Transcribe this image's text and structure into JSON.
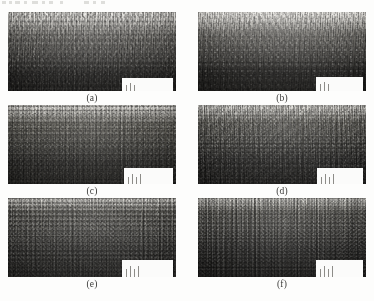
{
  "figure": {
    "background_color": "#fdfdfc",
    "label_color": "#3a3a38",
    "columns": 2,
    "rows": 3,
    "panels": [
      {
        "id": "a",
        "label": "(a)",
        "column": "left",
        "row": 1,
        "frame": {
          "x": 8,
          "y": 12,
          "width": 168,
          "height": 79
        },
        "label_y": 93,
        "texture": {
          "top_tone": "#e6e4df",
          "mid_tone": "#6f6d68",
          "bottom_tone": "#242321",
          "dark_band_start_pct": 52,
          "speckle_density": "high",
          "surface_roughness": "rough",
          "contrast": "high"
        },
        "notch": {
          "x_pct": 68,
          "y_pct": 83,
          "width_pct": 30,
          "height_pct": 17,
          "bars": 3
        }
      },
      {
        "id": "b",
        "label": "(b)",
        "column": "right",
        "row": 1,
        "frame": {
          "x": 198,
          "y": 12,
          "width": 168,
          "height": 79
        },
        "label_y": 93,
        "texture": {
          "top_tone": "#e4e2dd",
          "mid_tone": "#6b6964",
          "bottom_tone": "#201f1d",
          "dark_band_start_pct": 50,
          "speckle_density": "high",
          "surface_roughness": "rough",
          "contrast": "high"
        },
        "notch": {
          "x_pct": 70,
          "y_pct": 82,
          "width_pct": 28,
          "height_pct": 18,
          "bars": 3
        }
      },
      {
        "id": "c",
        "label": "(c)",
        "column": "left",
        "row": 2,
        "frame": {
          "x": 8,
          "y": 105,
          "width": 168,
          "height": 79
        },
        "label_y": 186,
        "texture": {
          "top_tone": "#dedcd6",
          "mid_tone": "#636159",
          "bottom_tone": "#2b2a27",
          "dark_band_start_pct": 46,
          "speckle_density": "very-high",
          "surface_roughness": "medium",
          "contrast": "medium"
        },
        "notch": {
          "x_pct": 69,
          "y_pct": 80,
          "width_pct": 29,
          "height_pct": 20,
          "bars": 4
        }
      },
      {
        "id": "d",
        "label": "(d)",
        "column": "right",
        "row": 2,
        "frame": {
          "x": 198,
          "y": 105,
          "width": 168,
          "height": 79
        },
        "label_y": 186,
        "texture": {
          "top_tone": "#dcdad4",
          "mid_tone": "#605e57",
          "bottom_tone": "#272624",
          "dark_band_start_pct": 44,
          "speckle_density": "very-high",
          "surface_roughness": "medium",
          "contrast": "medium"
        },
        "notch": {
          "x_pct": 71,
          "y_pct": 80,
          "width_pct": 27,
          "height_pct": 20,
          "bars": 4
        }
      },
      {
        "id": "e",
        "label": "(e)",
        "column": "left",
        "row": 3,
        "frame": {
          "x": 8,
          "y": 198,
          "width": 168,
          "height": 79
        },
        "label_y": 279,
        "texture": {
          "top_tone": "#d8d6cf",
          "mid_tone": "#5d5b54",
          "bottom_tone": "#2f2e2b",
          "dark_band_start_pct": 40,
          "speckle_density": "very-high",
          "surface_roughness": "fine",
          "contrast": "low"
        },
        "notch": {
          "x_pct": 68,
          "y_pct": 78,
          "width_pct": 30,
          "height_pct": 22,
          "bars": 4
        }
      },
      {
        "id": "f",
        "label": "(f)",
        "column": "right",
        "row": 3,
        "frame": {
          "x": 198,
          "y": 198,
          "width": 168,
          "height": 79
        },
        "label_y": 279,
        "texture": {
          "top_tone": "#dad8d1",
          "mid_tone": "#56544d",
          "bottom_tone": "#232220",
          "dark_band_start_pct": 38,
          "speckle_density": "very-high",
          "surface_roughness": "fine",
          "contrast": "medium"
        },
        "notch": {
          "x_pct": 70,
          "y_pct": 78,
          "width_pct": 28,
          "height_pct": 22,
          "bars": 4
        }
      }
    ],
    "scan_artifacts": [
      {
        "x": 2,
        "width": 4
      },
      {
        "x": 9,
        "width": 3
      },
      {
        "x": 15,
        "width": 5
      },
      {
        "x": 24,
        "width": 3
      },
      {
        "x": 32,
        "width": 6
      },
      {
        "x": 42,
        "width": 3
      },
      {
        "x": 49,
        "width": 4
      },
      {
        "x": 60,
        "width": 3
      },
      {
        "x": 84,
        "width": 5
      },
      {
        "x": 93,
        "width": 3
      },
      {
        "x": 101,
        "width": 4
      }
    ]
  }
}
